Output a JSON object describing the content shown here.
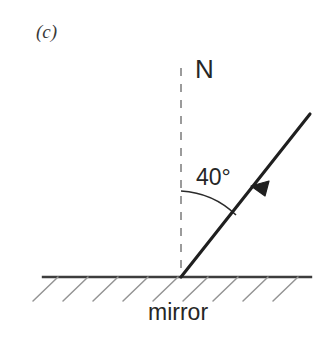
{
  "figure": {
    "panel_label": "(c)",
    "background_color": "#ffffff",
    "ink_color": "#262626",
    "hatch_color": "#8c8c8c"
  },
  "labels": {
    "normal": "N",
    "angle": "40°",
    "mirror": "mirror"
  },
  "diagram_data": {
    "type": "optics-reflection-diagram",
    "angle_of_incidence_degrees": 40,
    "angle_measured_from": "normal",
    "normal_line": {
      "style": "dashed",
      "x": 181,
      "y_top": 68,
      "y_bottom": 277,
      "label": "N"
    },
    "mirror_surface": {
      "y": 277,
      "x_start": 43,
      "x_end": 311,
      "hatch_count": 9,
      "hatch_direction": "down-left",
      "label": "mirror"
    },
    "incident_ray": {
      "from_x": 310,
      "from_y": 114,
      "to_x": 181,
      "to_y": 277,
      "arrow_position": "mid-line",
      "arrow_direction": "toward-mirror"
    },
    "angle_arc": {
      "center_x": 181,
      "center_y": 277,
      "radius": 86,
      "start_angle_deg": 90,
      "end_angle_deg": 50
    },
    "incidence_point": {
      "x": 181,
      "y": 277
    }
  }
}
